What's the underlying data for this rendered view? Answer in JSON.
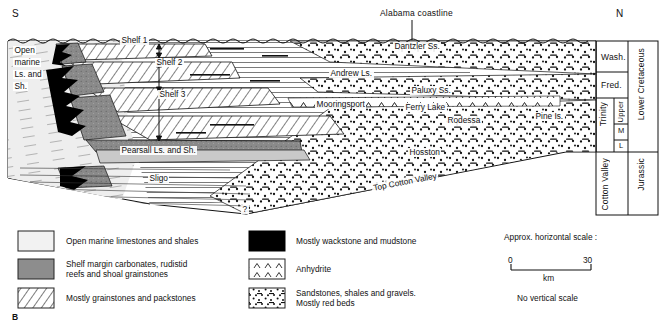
{
  "figure": {
    "panel_letter": "B",
    "orientation_left": "S",
    "orientation_right": "N",
    "coastline_label": "Alabama coastline"
  },
  "cross_section": {
    "left_block_text": [
      "Open",
      "marine",
      "Ls. and",
      "Sh."
    ],
    "shelf_labels": [
      "Shelf 1",
      "Shelf 2",
      "Shelf 3"
    ],
    "formation_labels": [
      {
        "name": "Dantzler Ss.",
        "x": 393,
        "y": 42
      },
      {
        "name": "Andrew Ls.",
        "x": 329,
        "y": 69
      },
      {
        "name": "Paluxy Ss.",
        "x": 410,
        "y": 86
      },
      {
        "name": "Mooringsport",
        "x": 315,
        "y": 100
      },
      {
        "name": "Ferry Lake",
        "x": 404,
        "y": 103
      },
      {
        "name": "Rodessa",
        "x": 446,
        "y": 116
      },
      {
        "name": "Pine Is.",
        "x": 534,
        "y": 112
      },
      {
        "name": "Pearsall Ls. and Sh.",
        "x": 120,
        "y": 146
      },
      {
        "name": "Sligo",
        "x": 148,
        "y": 174
      },
      {
        "name": "Hosston",
        "x": 408,
        "y": 148
      },
      {
        "name": "Top Cotton Valley",
        "x": 372,
        "y": 184
      }
    ],
    "query_mark": "?"
  },
  "strat_column": {
    "units": [
      "Wash.",
      "Fred.",
      "Trinity",
      "Upper",
      "M",
      "L",
      "Cotton Valley"
    ],
    "systems": [
      "Lower Cretaceous",
      "Jurassic"
    ]
  },
  "legend": {
    "left_items": [
      {
        "label": "Open marine limestones and shales",
        "pattern": "open-marine"
      },
      {
        "label": "Shelf margin carbonates, rudistid\nreefs and shoal grainstones",
        "pattern": "shelf-margin"
      },
      {
        "label": "Mostly grainstones and packstones",
        "pattern": "grainstone"
      }
    ],
    "right_items": [
      {
        "label": "Mostly wackstone and mudstone",
        "pattern": "wackstone"
      },
      {
        "label": "Anhydrite",
        "pattern": "anhydrite"
      },
      {
        "label": "Sandstones, shales and gravels.\nMostly red beds",
        "pattern": "sandstone"
      }
    ]
  },
  "scale": {
    "title": "Approx. horizontal scale :",
    "min": "0",
    "max": "30",
    "unit": "km",
    "note": "No vertical scale"
  }
}
